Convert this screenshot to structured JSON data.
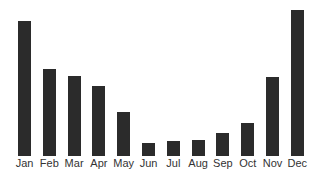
{
  "chart_data": {
    "type": "bar",
    "title": "",
    "xlabel": "",
    "ylabel": "",
    "categories": [
      "Jan",
      "Feb",
      "Mar",
      "Apr",
      "May",
      "Jun",
      "Jul",
      "Aug",
      "Sep",
      "Oct",
      "Nov",
      "Dec"
    ],
    "values": [
      135,
      87,
      80,
      70,
      44,
      13,
      15,
      16,
      23,
      33,
      79,
      146
    ],
    "value_units": "relative (no y-axis shown; measured bar heights in px)",
    "ylim": [
      0,
      150
    ],
    "grid": false,
    "legend": null,
    "bar_color": "#2b2b2b",
    "label_color": "#333333"
  },
  "layout": {
    "baseline_y": 156,
    "first_bar_x": 18,
    "bar_step": 24.8,
    "bar_width": 13
  }
}
